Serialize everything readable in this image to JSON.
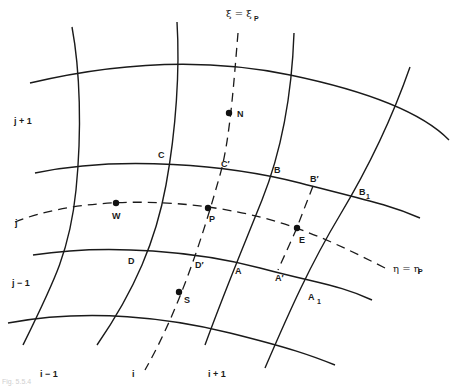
{
  "diagram": {
    "type": "curvilinear-grid",
    "colors": {
      "line": "#1a1a1a",
      "node": "#111111",
      "background": "#ffffff"
    },
    "coordinate_lines": {
      "xi_label": "ξ = ξ",
      "xi_sub": "P",
      "eta_label": "η = η",
      "eta_sub": "P"
    },
    "row_labels": {
      "j_plus_1": "j + 1",
      "j": "j",
      "j_minus_1": "j − 1"
    },
    "column_labels": {
      "i_minus_1": "i − 1",
      "i": "i",
      "i_plus_1": "i + 1"
    },
    "nodes": {
      "N": "N",
      "W": "W",
      "P": "P",
      "E": "E",
      "S": "S"
    },
    "points": {
      "C": "C",
      "C_prime": "C′",
      "B": "B",
      "B_prime": "B′",
      "B1": "B",
      "B1_sub": "1",
      "D": "D",
      "D_prime": "D′",
      "A": "A",
      "A_prime": "A′",
      "A1": "A",
      "A1_sub": "1"
    },
    "caption": "Fig. 5.5.4"
  }
}
